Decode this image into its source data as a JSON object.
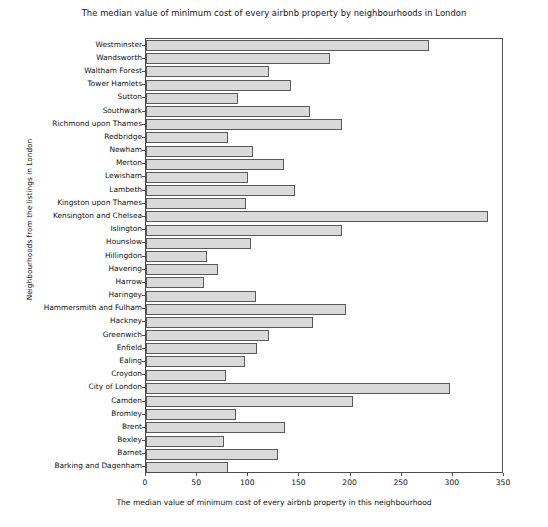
{
  "chart_data": {
    "type": "bar",
    "orientation": "horizontal",
    "title": "The median value of minimum cost of every airbnb property by neighbourhoods in London",
    "xlabel": "The median value of minimum cost of every airbnb property in this neighbourhood",
    "ylabel": "Neighbourhoods from the listings in London",
    "xlim": [
      0,
      350
    ],
    "xticks": [
      0,
      50,
      100,
      150,
      200,
      250,
      300,
      350
    ],
    "grid": false,
    "legend": null,
    "bar_color": "#d9d9d9",
    "bar_edge_color": "#595959",
    "categories": [
      "Westminster",
      "Wandsworth",
      "Waltham Forest",
      "Tower Hamlets",
      "Sutton",
      "Southwark",
      "Richmond upon Thames",
      "Redbridge",
      "Newham",
      "Merton",
      "Lewisham",
      "Lambeth",
      "Kingston upon Thames",
      "Kensington and Chelsea",
      "Islington",
      "Hounslow",
      "Hillingdon",
      "Havering",
      "Harrow",
      "Haringey",
      "Hammersmith and Fulham",
      "Hackney",
      "Greenwich",
      "Enfield",
      "Ealing",
      "Croydon",
      "City of London",
      "Camden",
      "Bromley",
      "Brent",
      "Bexley",
      "Barnet",
      "Barking and Dagenham"
    ],
    "values": [
      277,
      180,
      120,
      142,
      90,
      160,
      192,
      80,
      105,
      135,
      100,
      146,
      98,
      334,
      192,
      103,
      60,
      70,
      57,
      108,
      196,
      163,
      120,
      109,
      97,
      78,
      297,
      202,
      88,
      136,
      76,
      129,
      80
    ]
  }
}
